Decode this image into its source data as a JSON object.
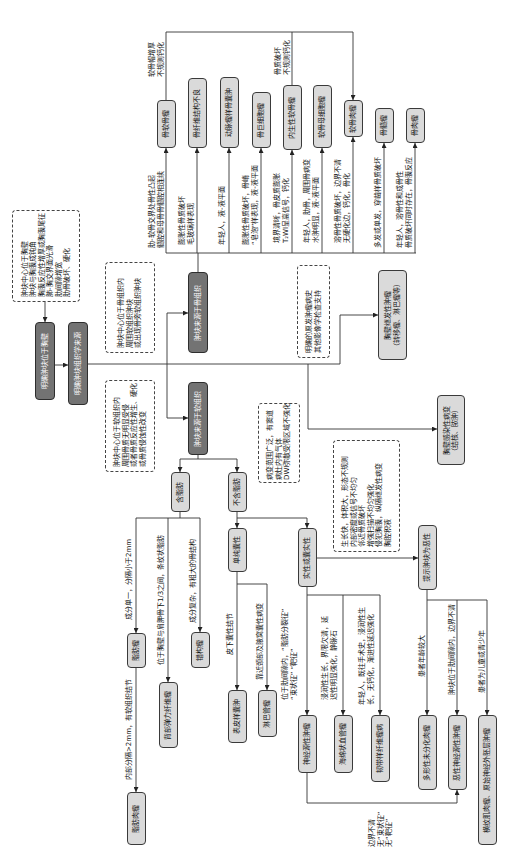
{
  "entry": {
    "wall_criteria": "肿块中心位于胸壁\n肿块与胸膜成钝角\n胸膜反应性增厚或胸膜尾征\n肺-胸交界面光滑\n肋间隙增宽\n肋骨破坏、硬化",
    "locate_label": "明确肿块位于胸壁",
    "origin_label": "明确肿块组织学来源"
  },
  "bone": {
    "criteria": "肿块中心位于骨组织内\n周围软组织肿块\n或出现骨旁软组织肿块",
    "label": "肿块来源于骨组织",
    "tumors": [
      {
        "name": "骨软骨瘤",
        "feature": "肋-软骨交界处骨性凸起\n髓腔和母骨骨髓腔相连续"
      },
      {
        "name": "骨纤维结构不良",
        "feature": "膨胀性骨质破坏\n毛玻璃样表现"
      },
      {
        "name": "动脉瘤样骨囊肿",
        "feature": "年轻人，液-液平面"
      },
      {
        "name": "骨巨细胞瘤",
        "feature": "膨胀性骨质破坏，骨嵴\n“皂泡”样表现，液-液平面"
      },
      {
        "name": "内生性软骨瘤",
        "feature": "境界清晰，骨皮质膨胀\nT₂WI呈高信号，钙化"
      },
      {
        "name": "软骨母细胞瘤",
        "feature": "年轻人，肋骨，周围骨病变\n水肿明显，液-液平面"
      },
      {
        "name": "软骨肉瘤",
        "feature": "溶骨性骨质破坏，边界不清\n无硬化边，钙化，骨化"
      },
      {
        "name": "骨髓瘤",
        "feature": "多发或单发，穿凿样骨质破坏"
      },
      {
        "name": "骨肉瘤",
        "feature": "年轻人，溶骨性和成骨性\n骨质破坏同时存在，骨膜反应"
      }
    ],
    "to_chondrosarcoma": [
      "软骨帽增厚\n不规则钙化",
      "骨质破坏\n不规则钙化"
    ]
  },
  "soft": {
    "criteria": "肿块中心位于软组织内\n周围骨质无明显受侵\n或者骨质反应性增生、硬化\n或骨质侵蚀性改变",
    "label": "肿块来源于软组织",
    "fat": {
      "label": "含脂肪",
      "tumors": [
        {
          "name": "脂肪瘤",
          "feature": "成分单一，分隔小于2mm"
        },
        {
          "name": "背部弹力纤维瘤",
          "feature": "位于胸壁与肩胛骨下1/3之间，条纹状脂肪"
        },
        {
          "name": "错构瘤",
          "feature": "成分复杂，有粗大的骨结构"
        }
      ],
      "liposarcoma": {
        "name": "脂肪肉瘤",
        "feature": "内部分隔>2mm，有软组织结节"
      }
    },
    "non_fat": {
      "label": "不含脂肪",
      "cystic": {
        "label": "单纯囊性",
        "tumors": [
          {
            "name": "表皮样囊肿",
            "feature": "皮下囊性结节"
          },
          {
            "name": "淋巴管瘤",
            "feature": "靠近颈部及腋窝囊性病变"
          }
        ]
      },
      "solid": {
        "label": "实性或囊实性",
        "tumors": [
          {
            "name": "神经源性肿瘤",
            "feature": "位于肋间隙内，“脂肪分裂征”\n“束状征” “靶征”"
          },
          {
            "name": "海绵状血管瘤",
            "feature": "浸润性生长，界限欠清，延\n迟性明显强化，静脉石"
          },
          {
            "name": "韧带样纤维瘤病",
            "feature": "年轻人，既往手术史，浸润性生\n长，无钙化，渐进性延迟强化"
          }
        ],
        "neuro_to_malignant": "边界不清\n无“束状征”\n无“靶征”"
      }
    },
    "malignant": {
      "criteria": "生长快，体积大，形态不规则\n内部密度或信号不均匀\n邻近骨质破坏\n增强扫描不均匀强化\n侵犯胸膜，纵隔继发性病变\n胸腔积液",
      "label": "提示肿块为恶性",
      "tumors": [
        {
          "name": "多形性未分化肉瘤",
          "feature": "患者年龄较大"
        },
        {
          "name": "恶性神经源性肿瘤",
          "feature": "肿块位于肋间隙内，边界不清"
        },
        {
          "name": "横纹肌肉瘤、原始神经外胚层肿瘤",
          "feature": "患者为儿童或青少年"
        }
      ]
    }
  },
  "secondary": {
    "criteria": "明确的原发肿瘤病史\n其他影像学检查支持",
    "label": "胸壁继发性肿瘤\n（转移瘤、淋巴瘤等）"
  },
  "infection": {
    "criteria": "病变范围广泛，有窦道\n病灶内有气体\nDWI弥散受限区域不强化",
    "label": "胸壁感染性病变\n（结核、脓肿）"
  }
}
